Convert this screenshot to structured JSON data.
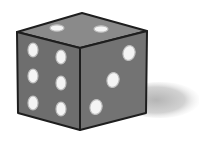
{
  "image": {
    "subject": "six-sided die",
    "style": "grayscale illustration",
    "faces": {
      "top": {
        "pips": 2
      },
      "left": {
        "pips": 6
      },
      "right": {
        "pips": 3
      }
    },
    "colors": {
      "background": "#ffffff",
      "top_face": "#8a8a8a",
      "left_face": "#6e6e6e",
      "right_face": "#727272",
      "edge": "#1e1e1e",
      "pip": "#f4f4f4",
      "pip_rim": "#bdbdbd",
      "shadow": "#c8c8c8"
    }
  }
}
